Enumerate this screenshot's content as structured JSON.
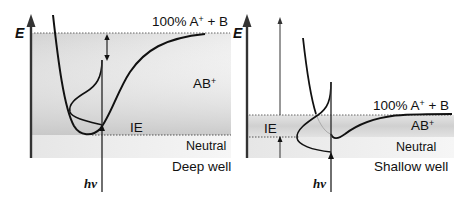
{
  "figure": {
    "panels": [
      {
        "id": "deep",
        "axis_label": "E",
        "asymptote_label": "100% A⁺ + B",
        "asymptote_main": "100% A",
        "asymptote_sup": "+",
        "asymptote_tail": " + B",
        "ion_state_main": "AB",
        "ion_state_sup": "+",
        "ionization_label": "IE",
        "neutral_label": "Neutral",
        "well_label": "Deep well",
        "photon_label": "hν"
      },
      {
        "id": "shallow",
        "axis_label": "E",
        "asymptote_label": "100% A⁺ + B",
        "asymptote_main": "100% A",
        "asymptote_sup": "+",
        "asymptote_tail": " + B",
        "ion_state_main": "AB",
        "ion_state_sup": "+",
        "ionization_label": "IE",
        "neutral_label": "Neutral",
        "well_label": "Shallow well",
        "photon_label": "hν"
      }
    ],
    "colors": {
      "line": "#111111",
      "ion_shade": "#c8c8c8",
      "neutral_shade": "#ebebeb",
      "background": "#ffffff"
    }
  }
}
